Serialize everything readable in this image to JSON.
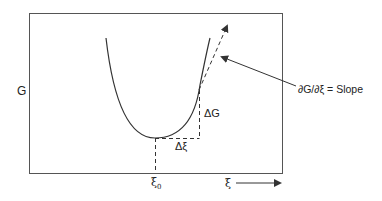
{
  "diagram": {
    "y_axis_label": "G",
    "x_axis_label": "ξ",
    "minimum_label": "ξ",
    "minimum_subscript": "0",
    "delta_g_label": "ΔG",
    "delta_xi_label": "Δξ",
    "slope_annotation": "∂G/∂ξ = Slope",
    "colors": {
      "line": "#333333",
      "frame": "#555555",
      "background": "#ffffff"
    }
  }
}
